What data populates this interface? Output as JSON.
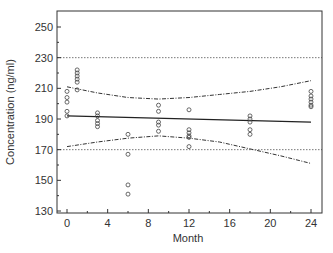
{
  "chart_data": {
    "type": "scatter",
    "title": "",
    "xlabel": "Month",
    "ylabel": "Concentration (ng/ml)",
    "xlim": [
      -1,
      25
    ],
    "ylim": [
      130,
      260
    ],
    "x_ticks": [
      0,
      4,
      8,
      12,
      16,
      20,
      24
    ],
    "y_ticks": [
      130,
      150,
      170,
      190,
      210,
      230,
      250
    ],
    "grid": false,
    "legend": null,
    "reference_lines": [
      {
        "name": "upper-spec-limit",
        "y": 230,
        "style": "dotted"
      },
      {
        "name": "lower-spec-limit",
        "y": 170,
        "style": "dotted"
      }
    ],
    "regression_line": {
      "x": [
        0,
        24
      ],
      "y": [
        192,
        188
      ],
      "style": "solid"
    },
    "confidence_bands": {
      "upper": {
        "x": [
          0,
          3,
          6,
          9,
          12,
          15,
          18,
          21,
          24
        ],
        "y": [
          211,
          207,
          204,
          203,
          204,
          206,
          208,
          211,
          215
        ],
        "style": "dash-dot"
      },
      "lower": {
        "x": [
          0,
          3,
          6,
          9,
          12,
          15,
          18,
          21,
          24
        ],
        "y": [
          172,
          175,
          177.5,
          179,
          177.5,
          175,
          170.5,
          166,
          161
        ],
        "style": "dash-dot"
      }
    },
    "points": [
      {
        "x": 0,
        "y": 208
      },
      {
        "x": 0,
        "y": 204
      },
      {
        "x": 0,
        "y": 201
      },
      {
        "x": 0,
        "y": 195
      },
      {
        "x": 0,
        "y": 192
      },
      {
        "x": 1,
        "y": 222
      },
      {
        "x": 1,
        "y": 220
      },
      {
        "x": 1,
        "y": 218
      },
      {
        "x": 1,
        "y": 216
      },
      {
        "x": 1,
        "y": 214
      },
      {
        "x": 1,
        "y": 209
      },
      {
        "x": 3,
        "y": 194
      },
      {
        "x": 3,
        "y": 192
      },
      {
        "x": 3,
        "y": 189
      },
      {
        "x": 3,
        "y": 187
      },
      {
        "x": 3,
        "y": 185
      },
      {
        "x": 6,
        "y": 180
      },
      {
        "x": 6,
        "y": 167
      },
      {
        "x": 6,
        "y": 147
      },
      {
        "x": 6,
        "y": 141
      },
      {
        "x": 9,
        "y": 199
      },
      {
        "x": 9,
        "y": 195
      },
      {
        "x": 9,
        "y": 188
      },
      {
        "x": 9,
        "y": 186
      },
      {
        "x": 9,
        "y": 182
      },
      {
        "x": 12,
        "y": 196
      },
      {
        "x": 12,
        "y": 183
      },
      {
        "x": 12,
        "y": 181
      },
      {
        "x": 12,
        "y": 179
      },
      {
        "x": 12,
        "y": 178
      },
      {
        "x": 12,
        "y": 172
      },
      {
        "x": 18,
        "y": 192
      },
      {
        "x": 18,
        "y": 190
      },
      {
        "x": 18,
        "y": 188
      },
      {
        "x": 18,
        "y": 183
      },
      {
        "x": 18,
        "y": 180
      },
      {
        "x": 24,
        "y": 208
      },
      {
        "x": 24,
        "y": 205
      },
      {
        "x": 24,
        "y": 203
      },
      {
        "x": 24,
        "y": 201
      },
      {
        "x": 24,
        "y": 199
      },
      {
        "x": 24,
        "y": 198
      }
    ]
  },
  "colors": {
    "axis": "#333333",
    "points": "#444444",
    "regression": "#222222",
    "bands": "#333333",
    "reference": "#555555"
  }
}
